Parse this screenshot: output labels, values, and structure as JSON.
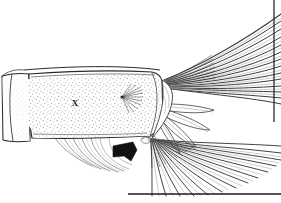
{
  "figure": {
    "kind": "scientific-line-drawing",
    "technique": "ink stipple and line hatching",
    "canvas": {
      "width": 281,
      "height": 203
    },
    "background_color": "#ffffff",
    "ink_color": "#1a1a1a",
    "stipple_color": "#7a7a7a",
    "ray_color": "#3a3a3a",
    "faint_ray_color": "#8e8e8e"
  },
  "annotations": {
    "body_label": {
      "text": "X",
      "name": "label-x",
      "x": 75,
      "y": 103,
      "meaning": "landmark marker on caudal peduncle"
    },
    "pointer": {
      "name": "black-arrowhead",
      "description": "solid black triangular arrowhead indicating base of lower caudal fin rays",
      "tip_x": 136,
      "tip_y": 152,
      "color": "#111111"
    }
  },
  "structures": {
    "peduncle": {
      "name": "caudal-peduncle",
      "description": "stippled rectangular trunk segment with scale texture",
      "fill": "#ffffff",
      "outline": "#2a2a2a"
    },
    "trunk_segment": {
      "name": "anterior-body-segment",
      "description": "partial body segment at left edge with vertical myoseptum line"
    },
    "pore": {
      "name": "sensory-pore-rosette",
      "description": "small radiating rosette of fine lines on posterior peduncle",
      "x": 130,
      "y": 97
    },
    "hypural_plate": {
      "name": "hypural-plate",
      "description": "wedge of tail base between peduncle and fin rays"
    },
    "upper_caudal_rays": {
      "name": "upper-caudal-ray-fan",
      "description": "long dark principal rays sweeping to upper right",
      "count": 22
    },
    "middle_caudal_rays": {
      "name": "middle-caudal-ray-lobe",
      "description": "broad blunt-tipped branched rays forming central lobe",
      "count": 6
    },
    "lower_caudal_rays": {
      "name": "lower-caudal-ray-fan",
      "description": "dense fan of rays sweeping down and right across baseline",
      "count": 26
    },
    "ventral_rays": {
      "name": "ventral-procurrent-rays",
      "description": "sparse curved faint rays below the peduncle on the left",
      "count": 7
    },
    "baseline": {
      "name": "plate-baseline",
      "description": "horizontal rule at bottom of the plate"
    },
    "right_border": {
      "name": "plate-right-border",
      "description": "vertical rule at right edge of the plate"
    }
  }
}
